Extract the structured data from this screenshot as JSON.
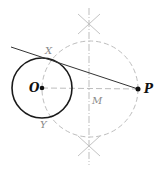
{
  "diagram": {
    "labels": {
      "O": "O",
      "P": "P",
      "M": "M",
      "X": "X",
      "Y": "Y"
    },
    "points": {
      "O": [
        42,
        88
      ],
      "P": [
        138,
        89
      ],
      "M": [
        90,
        89
      ],
      "X": [
        47,
        59
      ],
      "Y": [
        45,
        118
      ]
    },
    "circle_O": {
      "cx": 42,
      "cy": 88,
      "r": 30,
      "style": "solid",
      "color": "#1a1a1a"
    },
    "circle_M": {
      "cx": 90,
      "cy": 89,
      "r": 48,
      "style": "dashed",
      "color": "#b5b5b5"
    },
    "bisector": {
      "x": 89,
      "y1": 8,
      "y2": 165,
      "style": "dash-dot",
      "color": "#b5b5b5"
    },
    "tangent_line": {
      "x1": 11,
      "y1": 47,
      "x2": 138,
      "y2": 89,
      "color": "#333333"
    },
    "colors": {
      "construction": "#b5b5b5",
      "main": "#1a1a1a",
      "label_muted": "#8a8a8a"
    }
  }
}
